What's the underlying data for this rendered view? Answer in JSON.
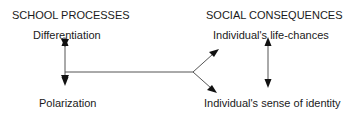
{
  "diagram": {
    "left_column": {
      "heading": "SCHOOL PROCESSES",
      "top_node": "Differentiation",
      "bottom_node": "Polarization"
    },
    "right_column": {
      "heading": "SOCIAL CONSEQUENCES",
      "top_node": "Individual's life-chances",
      "bottom_node": "Individual's sense of identity"
    },
    "connections": [
      {
        "from": "Differentiation",
        "to": "Polarization",
        "type": "bidirectional"
      },
      {
        "from": "school processes",
        "to": "Individual's life-chances",
        "type": "directed"
      },
      {
        "from": "school processes",
        "to": "Individual's sense of identity",
        "type": "directed"
      },
      {
        "from": "Individual's life-chances",
        "to": "Individual's sense of identity",
        "type": "bidirectional"
      }
    ],
    "colors": {
      "line": "#555555",
      "arrowhead": "#111111",
      "text": "#1a1a1a"
    }
  }
}
